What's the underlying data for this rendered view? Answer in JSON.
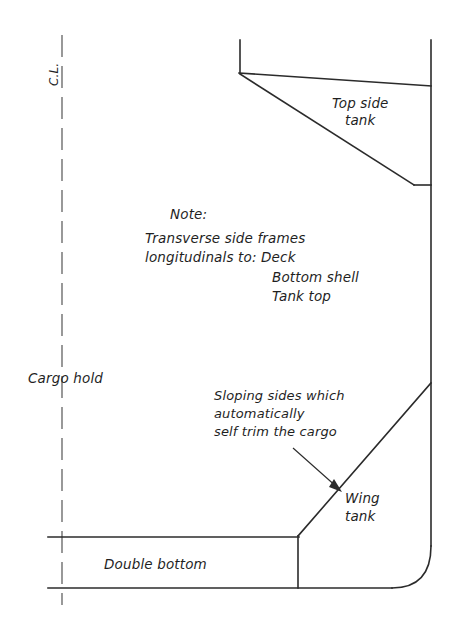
{
  "drawing": {
    "title": "Bulk carrier midship section",
    "ink_color": "#2b2b2b",
    "centerline_color": "#555555",
    "background_color": "#ffffff",
    "labels": {
      "centerline": "C.L.",
      "top_side_tank_line1": "Top side",
      "top_side_tank_line2": "tank",
      "cargo_hold": "Cargo hold",
      "wing_tank_line1": "Wing",
      "wing_tank_line2": "tank",
      "double_bottom": "Double bottom"
    },
    "note": {
      "heading": "Note:",
      "line1": "Transverse side frames",
      "line2": "longitudinals to: Deck",
      "line3": "Bottom shell",
      "line4": "Tank top"
    },
    "callout": {
      "line1": "Sloping sides which",
      "line2": "automatically",
      "line3": "self trim the cargo"
    }
  }
}
